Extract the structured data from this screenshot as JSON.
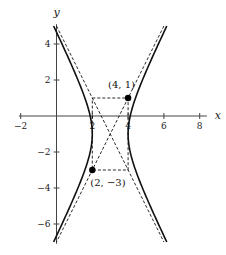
{
  "chart_data": {
    "type": "line",
    "title": "",
    "xlabel": "x",
    "ylabel": "y",
    "xlim": [
      -2,
      8.5
    ],
    "ylim": [
      -7,
      5.5
    ],
    "grid": false,
    "x_ticks": [
      {
        "value": -2,
        "label": "−2"
      },
      {
        "value": 2,
        "label": "2"
      },
      {
        "value": 4,
        "label": "4"
      },
      {
        "value": 6,
        "label": "6"
      },
      {
        "value": 8,
        "label": "8"
      }
    ],
    "y_ticks": [
      {
        "value": 4,
        "label": "4"
      },
      {
        "value": 2,
        "label": "2"
      },
      {
        "value": -2,
        "label": "−2"
      },
      {
        "value": -4,
        "label": "−4"
      },
      {
        "value": -6,
        "label": "−6"
      }
    ],
    "hyperbola": {
      "equation": "(x-3)^2 - (y+1)^2/4 = 1",
      "center": [
        3,
        -1
      ],
      "a": 1,
      "b": 2,
      "y_range": [
        -7,
        5
      ],
      "style": "solid"
    },
    "asymptotes": [
      {
        "equation": "y + 1 = 2(x - 3)",
        "slope": 2,
        "style": "dashed"
      },
      {
        "equation": "y + 1 = -2(x - 3)",
        "slope": -2,
        "style": "dashed"
      }
    ],
    "fundamental_rectangle": {
      "corners": [
        [
          2,
          1
        ],
        [
          4,
          1
        ],
        [
          4,
          -3
        ],
        [
          2,
          -3
        ]
      ],
      "style": "dashed"
    },
    "points": [
      {
        "x": 4,
        "y": 1,
        "label": "(4, 1)"
      },
      {
        "x": 2,
        "y": -3,
        "label": "(2, −3)"
      }
    ]
  },
  "layout": {
    "origin_px": [
      56.5,
      116
    ],
    "scale_px": [
      17.9,
      18
    ]
  }
}
